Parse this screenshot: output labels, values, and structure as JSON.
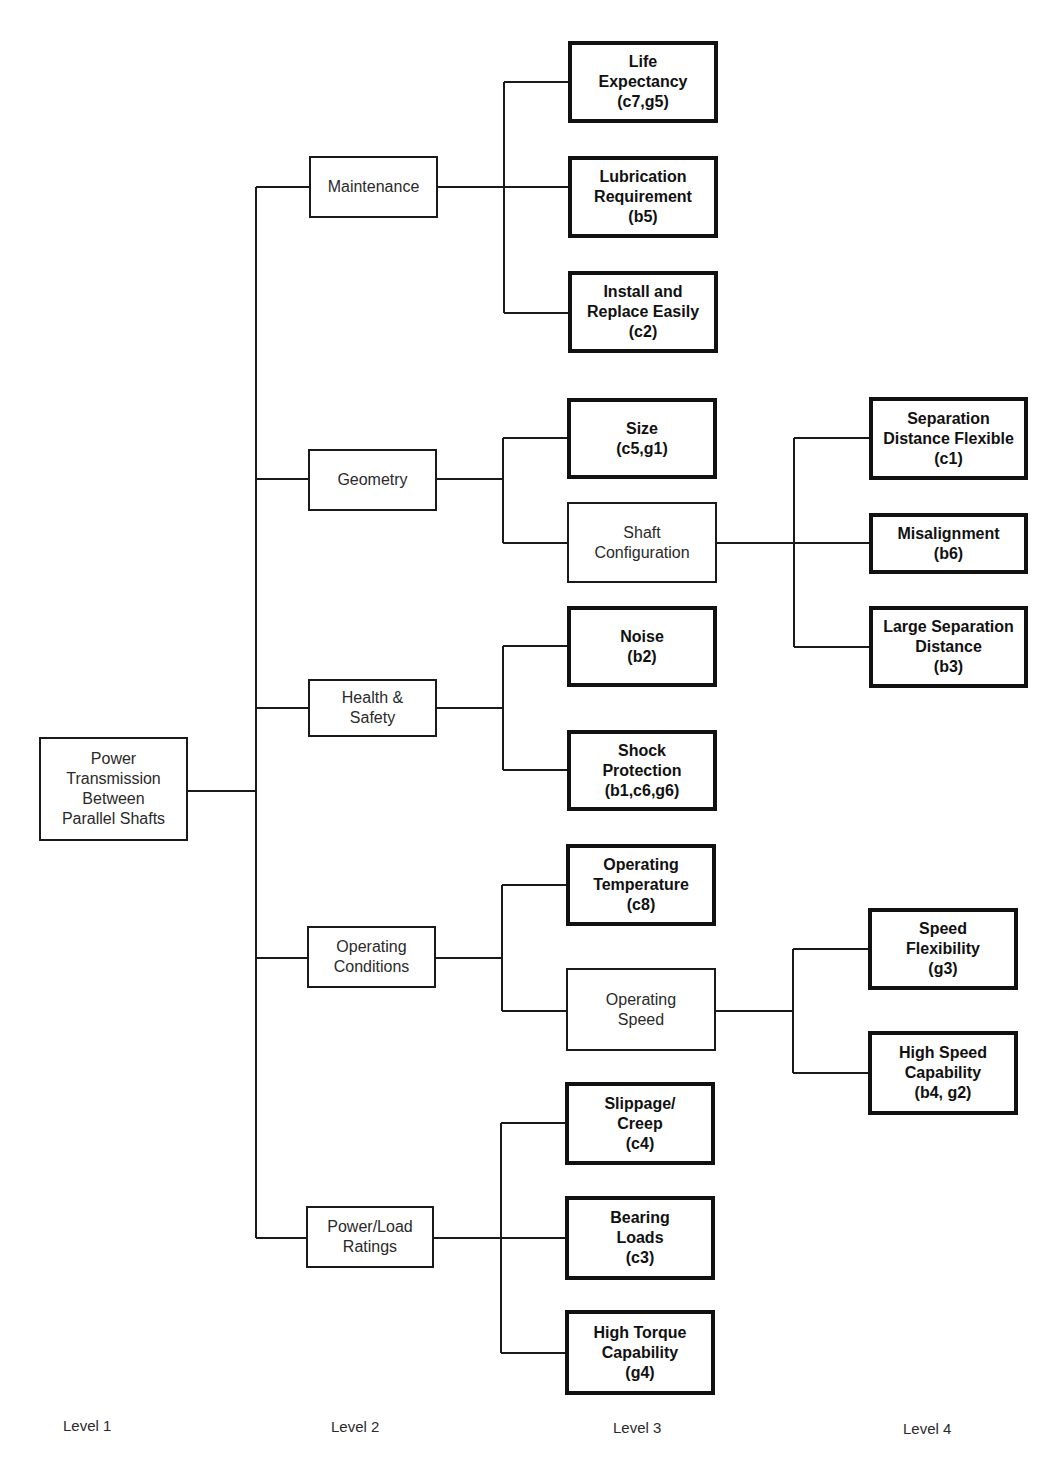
{
  "diagram": {
    "root": {
      "label": "Power\nTransmission\nBetween\nParallel Shafts"
    },
    "level2": [
      {
        "label": "Maintenance"
      },
      {
        "label": "Geometry"
      },
      {
        "label": "Health &\nSafety"
      },
      {
        "label": "Operating\nConditions"
      },
      {
        "label": "Power/Load\nRatings"
      }
    ],
    "level3": [
      {
        "label": "Life\nExpectancy\n(c7,g5)",
        "parent": "Maintenance",
        "leaf": true
      },
      {
        "label": "Lubrication\nRequirement\n(b5)",
        "parent": "Maintenance",
        "leaf": true
      },
      {
        "label": "Install and\nReplace Easily\n(c2)",
        "parent": "Maintenance",
        "leaf": true
      },
      {
        "label": "Size\n(c5,g1)",
        "parent": "Geometry",
        "leaf": true
      },
      {
        "label": "Shaft\nConfiguration",
        "parent": "Geometry",
        "leaf": false
      },
      {
        "label": "Noise\n(b2)",
        "parent": "Health & Safety",
        "leaf": true
      },
      {
        "label": "Shock\nProtection\n(b1,c6,g6)",
        "parent": "Health & Safety",
        "leaf": true
      },
      {
        "label": "Operating\nTemperature\n(c8)",
        "parent": "Operating Conditions",
        "leaf": true
      },
      {
        "label": "Operating\nSpeed",
        "parent": "Operating Conditions",
        "leaf": false
      },
      {
        "label": "Slippage/\nCreep\n(c4)",
        "parent": "Power/Load Ratings",
        "leaf": true
      },
      {
        "label": "Bearing\nLoads\n(c3)",
        "parent": "Power/Load Ratings",
        "leaf": true
      },
      {
        "label": "High Torque\nCapability\n(g4)",
        "parent": "Power/Load Ratings",
        "leaf": true
      }
    ],
    "level4": [
      {
        "label": "Separation\nDistance Flexible\n(c1)",
        "parent": "Shaft Configuration"
      },
      {
        "label": "Misalignment\n(b6)",
        "parent": "Shaft Configuration"
      },
      {
        "label": "Large Separation\nDistance\n(b3)",
        "parent": "Shaft Configuration"
      },
      {
        "label": "Speed\nFlexibility\n(g3)",
        "parent": "Operating Speed"
      },
      {
        "label": "High Speed\nCapability\n(b4, g2)",
        "parent": "Operating Speed"
      }
    ],
    "level_labels": [
      "Level 1",
      "Level 2",
      "Level 3",
      "Level 4"
    ],
    "colors": {
      "line": "#1a1a1a",
      "background": "#ffffff"
    }
  }
}
